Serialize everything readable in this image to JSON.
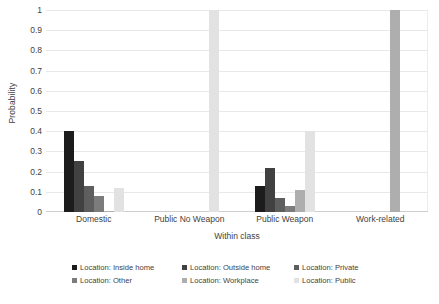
{
  "chart_data": {
    "type": "bar",
    "title": "",
    "xlabel": "Within class",
    "ylabel": "Probability",
    "ylim": [
      0,
      1
    ],
    "yticks": [
      "0",
      "0.1",
      "0.2",
      "0.3",
      "0.4",
      "0.5",
      "0.6",
      "0.7",
      "0.8",
      "0.9",
      "1"
    ],
    "grid": true,
    "legend_position": "bottom",
    "categories": [
      "Domestic",
      "Public No Weapon",
      "Public Weapon",
      "Work-related"
    ],
    "series": [
      {
        "name": "Location: Inside home",
        "color": "#1c1c1c",
        "values": [
          0.4,
          0.0,
          0.128,
          0.0
        ]
      },
      {
        "name": "Location: Outside home",
        "color": "#414141",
        "values": [
          0.255,
          0.0,
          0.22,
          0.0
        ]
      },
      {
        "name": "Location: Private",
        "color": "#5e5e5e",
        "values": [
          0.128,
          0.0,
          0.068,
          0.0
        ]
      },
      {
        "name": "Location: Other",
        "color": "#7c7c7c",
        "values": [
          0.077,
          0.0,
          0.028,
          0.0
        ]
      },
      {
        "name": "Location: Workplace",
        "color": "#aeaeae",
        "values": [
          0.005,
          0.0,
          0.108,
          1.0
        ]
      },
      {
        "name": "Location: Public",
        "color": "#e2e2e2",
        "values": [
          0.12,
          1.0,
          0.4,
          0.0
        ]
      }
    ]
  },
  "legend": {
    "rows": [
      [
        "Location: Inside home",
        "Location: Outside home",
        "Location: Private"
      ],
      [
        "Location: Other",
        "Location: Workplace",
        "Location: Public"
      ]
    ]
  }
}
